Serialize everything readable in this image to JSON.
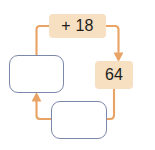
{
  "diagram": {
    "type": "cycle-flowchart",
    "title": "",
    "colors": {
      "node_fill": "#f7dfc2",
      "node_blank_fill": "#ffffff",
      "node_blank_border": "#7b88a8",
      "connector": "#e8a365",
      "text": "#1d1d1b",
      "background": "#ffffff"
    },
    "nodes": [
      {
        "id": "op",
        "kind": "operation",
        "label": "+ 18",
        "style": "filled"
      },
      {
        "id": "value",
        "kind": "value",
        "label": "64",
        "style": "filled"
      },
      {
        "id": "input-left",
        "kind": "blank",
        "label": "",
        "style": "outlined"
      },
      {
        "id": "input-bottom",
        "kind": "blank",
        "label": "",
        "style": "outlined"
      }
    ],
    "connectors": [
      {
        "id": "op-to-value",
        "from": "op",
        "to": "value",
        "arrowhead": "down",
        "routing": "elbow-right"
      },
      {
        "id": "value-to-input-bottom",
        "from": "value",
        "to": "input-bottom",
        "arrowhead": "none",
        "routing": "elbow-bottom-right"
      },
      {
        "id": "input-bottom-to-input-left",
        "from": "input-bottom",
        "to": "input-left",
        "arrowhead": "up",
        "routing": "elbow-bottom-left"
      },
      {
        "id": "input-left-to-op",
        "from": "input-left",
        "to": "op",
        "arrowhead": "none",
        "routing": "elbow-top-left"
      }
    ]
  }
}
